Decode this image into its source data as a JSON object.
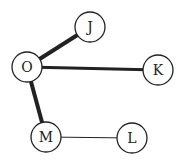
{
  "diagram": {
    "type": "graph",
    "colors": {
      "stroke": "#222222",
      "fill": "#ffffff",
      "background": "#ffffff"
    },
    "nodes": [
      {
        "id": "J",
        "label": "J",
        "cx": 90,
        "cy": 27,
        "r": 15
      },
      {
        "id": "O",
        "label": "O",
        "cx": 27,
        "cy": 67,
        "r": 15
      },
      {
        "id": "K",
        "label": "K",
        "cx": 158,
        "cy": 70,
        "r": 15
      },
      {
        "id": "M",
        "label": "M",
        "cx": 46,
        "cy": 137,
        "r": 15
      },
      {
        "id": "L",
        "label": "L",
        "cx": 132,
        "cy": 138,
        "r": 15
      }
    ],
    "edges": [
      {
        "from": "O",
        "to": "J",
        "weight": "thick",
        "width": 4
      },
      {
        "from": "O",
        "to": "K",
        "weight": "thick",
        "width": 3
      },
      {
        "from": "O",
        "to": "M",
        "weight": "thick",
        "width": 4
      },
      {
        "from": "M",
        "to": "L",
        "weight": "thin",
        "width": 1
      }
    ]
  }
}
